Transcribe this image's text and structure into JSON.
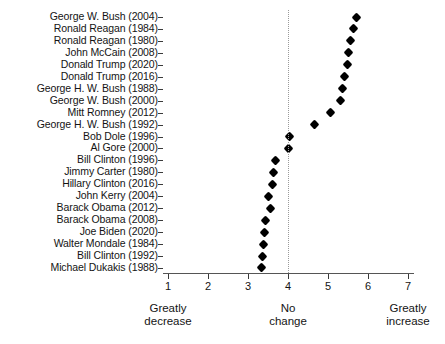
{
  "chart_data": {
    "type": "scatter",
    "title": "",
    "subtitle": "",
    "xlabel": "",
    "ylabel": "",
    "xlim": [
      1,
      7
    ],
    "grid": false,
    "legend": null,
    "orientation": "horizontal-dotplot",
    "reference_line": {
      "value": 4,
      "style": "dotted",
      "color": "#9a9a9a",
      "label": "No change"
    },
    "xticks": [
      1,
      2,
      3,
      4,
      5,
      6,
      7
    ],
    "xtick_labels": [
      "1",
      "2",
      "3",
      "4",
      "5",
      "6",
      "7"
    ],
    "anchor_labels": [
      {
        "value": 1,
        "line1": "Greatly",
        "line2": "decrease"
      },
      {
        "value": 4,
        "line1": "No",
        "line2": "change"
      },
      {
        "value": 7,
        "line1": "Greatly",
        "line2": "increase"
      }
    ],
    "categories": [
      "George W. Bush (2004)",
      "Ronald Reagan (1984)",
      "Ronald Reagan (1980)",
      "John McCain (2008)",
      "Donald Trump (2020)",
      "Donald Trump (2016)",
      "George H. W. Bush (1988)",
      "George W. Bush (2000)",
      "Mitt Romney (2012)",
      "George H. W. Bush (1992)",
      "Bob Dole (1996)",
      "Al Gore (2000)",
      "Bill Clinton (1996)",
      "Jimmy Carter (1980)",
      "Hillary Clinton (2016)",
      "John Kerry (2004)",
      "Barack Obama (2012)",
      "Barack Obama (2008)",
      "Joe Biden (2020)",
      "Walter Mondale (1984)",
      "Bill Clinton (1992)",
      "Michael Dukakis (1988)"
    ],
    "values": [
      5.7,
      5.63,
      5.55,
      5.5,
      5.48,
      5.4,
      5.35,
      5.3,
      5.05,
      4.65,
      4.03,
      4.0,
      3.68,
      3.63,
      3.6,
      3.5,
      3.55,
      3.43,
      3.4,
      3.38,
      3.35,
      3.33
    ]
  }
}
